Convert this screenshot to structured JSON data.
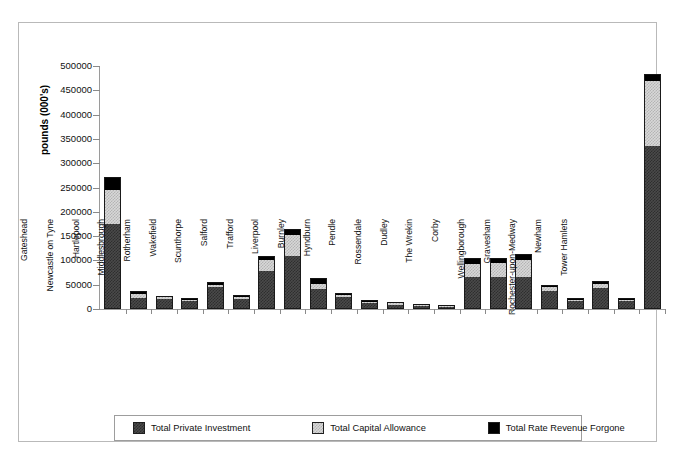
{
  "chart_data": {
    "type": "bar",
    "stacked": true,
    "title": "",
    "xlabel": "",
    "ylabel": "pounds (000's)",
    "ylim": [
      0,
      500000
    ],
    "ytick_step": 50000,
    "ytick_labels": [
      "500000",
      "450000",
      "400000",
      "350000",
      "300000",
      "250000",
      "200000",
      "150000",
      "100000",
      "50000",
      "0"
    ],
    "grid": false,
    "legend_position": "bottom",
    "categories": [
      "Gateshead",
      "Newcastle on Tyne",
      "Hartlepool",
      "Middlesbrough",
      "Rotherham",
      "Wakefield",
      "Scunthorpe",
      "Salford",
      "Trafford",
      "Liverpool",
      "Burnley",
      "Hyndburn",
      "Pendle",
      "Rossendale",
      "Dudley",
      "The Wrekin",
      "Corby",
      "Wellingborough",
      "Gravesham",
      "Rochester-upon-Medway",
      "Newham",
      "Tower Hamlets"
    ],
    "series": [
      {
        "name": "Total Private Investment",
        "color": "#3c3c3c",
        "values": [
          175000,
          23000,
          21000,
          17000,
          46000,
          21000,
          78000,
          110000,
          42000,
          24000,
          13000,
          9000,
          6000,
          4000,
          65000,
          66000,
          66000,
          38000,
          16000,
          44000,
          17000,
          335000
        ]
      },
      {
        "name": "Total Capital Allowance",
        "color": "#d0d0d0",
        "values": [
          70000,
          7000,
          3000,
          2000,
          4000,
          3000,
          22000,
          43000,
          10000,
          4000,
          1000,
          1000,
          1000,
          500,
          28000,
          28000,
          35000,
          7000,
          3000,
          7000,
          2000,
          134000
        ]
      },
      {
        "name": "Total Rate Revenue Forgone",
        "color": "#000000",
        "values": [
          27000,
          8000,
          3000,
          3000,
          5000,
          4000,
          10000,
          11000,
          11000,
          5000,
          2000,
          1000,
          1000,
          500,
          13000,
          11000,
          12000,
          5000,
          3000,
          6000,
          3000,
          14000
        ]
      }
    ],
    "totals": [
      272000,
      38000,
      27000,
      22000,
      55000,
      28000,
      110000,
      164000,
      63000,
      33000,
      16000,
      11000,
      8000,
      5000,
      106000,
      105000,
      113000,
      50000,
      22000,
      57000,
      22000,
      483000
    ]
  },
  "legend": {
    "items": [
      {
        "label": "Total Private Investment",
        "swatch": "invest-swatch"
      },
      {
        "label": "Total Capital Allowance",
        "swatch": "allowance-swatch"
      },
      {
        "label": "Total Rate Revenue Forgone",
        "swatch": "rate-swatch"
      }
    ]
  }
}
